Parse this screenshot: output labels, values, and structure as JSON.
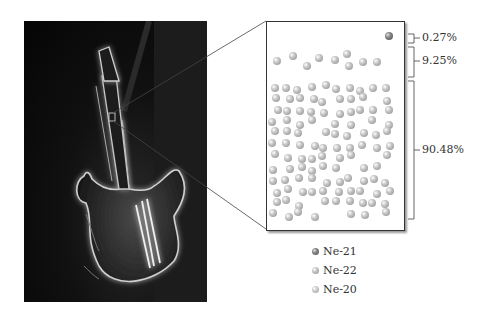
{
  "figure": {
    "photo": {
      "subject": "neon guitar sign",
      "icon": "neon-guitar-photo"
    },
    "zoom_box": {
      "description": "magnified view of neon atoms"
    },
    "brackets": [
      {
        "label": "0.27%",
        "isotope": "Ne-21"
      },
      {
        "label": "9.25%",
        "isotope": "Ne-22"
      },
      {
        "label": "90.48%",
        "isotope": "Ne-20"
      }
    ],
    "legend": [
      {
        "label": "Ne-21",
        "color": "#6a6a6a"
      },
      {
        "label": "Ne-22",
        "color": "#9a9a9a"
      },
      {
        "label": "Ne-20",
        "color": "#b0b0b0"
      }
    ]
  },
  "chart_data": {
    "type": "pie",
    "categories": [
      "Ne-21",
      "Ne-22",
      "Ne-20"
    ],
    "values": [
      0.27,
      9.25,
      90.48
    ],
    "unit": "%"
  }
}
